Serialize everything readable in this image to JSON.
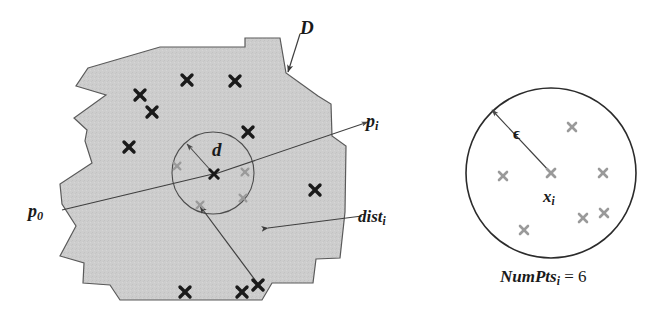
{
  "figure": {
    "background_color": "#ffffff",
    "region_fill": "#cccccc",
    "region_stroke": "#555555",
    "marker_dark_color": "#1a1a1a",
    "marker_light_color": "#9a9a9a",
    "line_color": "#4a4a4a"
  },
  "labels": {
    "region": "D",
    "radius_inner": "d",
    "point_start": "p",
    "point_start_sub": "0",
    "point_i": "p",
    "point_i_sub": "i",
    "distance": "dist",
    "distance_sub": "i",
    "epsilon": "ϵ",
    "center_point": "x",
    "center_point_sub": "i",
    "numpts_name": "NumPts",
    "numpts_sub": "i",
    "numpts_eq": "=",
    "numpts_value": "6"
  },
  "left_panel": {
    "name": "density-region-panel",
    "region_polygon": "88,68 160,47 245,47 245,38 280,38 286,73 318,96 331,104 332,136 346,146 345,212 340,258 316,259 313,283 272,283 262,300 120,300 110,285 83,283 84,263 60,256 76,226 62,204 60,184 92,163 85,141 87,130 74,118 106,95 76,86",
    "inner_circle": {
      "cx": 213,
      "cy": 173,
      "r": 41
    },
    "dark_markers": [
      {
        "x": 140,
        "y": 95
      },
      {
        "x": 187,
        "y": 80
      },
      {
        "x": 235,
        "y": 81
      },
      {
        "x": 152,
        "y": 112
      },
      {
        "x": 129,
        "y": 147
      },
      {
        "x": 248,
        "y": 132
      },
      {
        "x": 315,
        "y": 190
      },
      {
        "x": 185,
        "y": 292
      },
      {
        "x": 242,
        "y": 292
      },
      {
        "x": 258,
        "y": 285
      }
    ],
    "light_markers": [
      {
        "x": 177,
        "y": 166
      },
      {
        "x": 245,
        "y": 172
      },
      {
        "x": 243,
        "y": 198
      },
      {
        "x": 200,
        "y": 205
      }
    ],
    "center_marker": {
      "x": 214,
      "y": 174
    },
    "radius_arrow": {
      "x1": 213,
      "y1": 173,
      "x2": 187,
      "y2": 144
    },
    "p0_line": {
      "x1": 62,
      "y1": 210,
      "x2": 213,
      "y2": 174
    },
    "pi_line": {
      "x1": 215,
      "y1": 174,
      "x2": 368,
      "y2": 122
    },
    "dist_line_label": {
      "x1": 268,
      "y1": 228,
      "x2": 362,
      "y2": 216
    },
    "dist_arrow": {
      "x1": 258,
      "y1": 284,
      "x2": 200,
      "y2": 206
    }
  },
  "right_panel": {
    "name": "epsilon-neighborhood-panel",
    "circle": {
      "cx": 551,
      "cy": 173,
      "r": 85
    },
    "center_marker": {
      "x": 551,
      "y": 173
    },
    "epsilon_arrow": {
      "x1": 551,
      "y1": 173,
      "x2": 492,
      "y2": 110
    },
    "neighbor_markers": [
      {
        "x": 572,
        "y": 127
      },
      {
        "x": 503,
        "y": 176
      },
      {
        "x": 603,
        "y": 173
      },
      {
        "x": 583,
        "y": 218
      },
      {
        "x": 604,
        "y": 213
      },
      {
        "x": 524,
        "y": 230
      }
    ]
  },
  "label_positions": {
    "D": {
      "x": 300,
      "y": 18
    },
    "d": {
      "x": 212,
      "y": 140
    },
    "p0": {
      "x": 28,
      "y": 202
    },
    "pi": {
      "x": 366,
      "y": 112
    },
    "dist": {
      "x": 358,
      "y": 208
    },
    "epsilon": {
      "x": 513,
      "y": 125
    },
    "xi": {
      "x": 543,
      "y": 188
    },
    "numpts": {
      "x": 500,
      "y": 268
    }
  }
}
